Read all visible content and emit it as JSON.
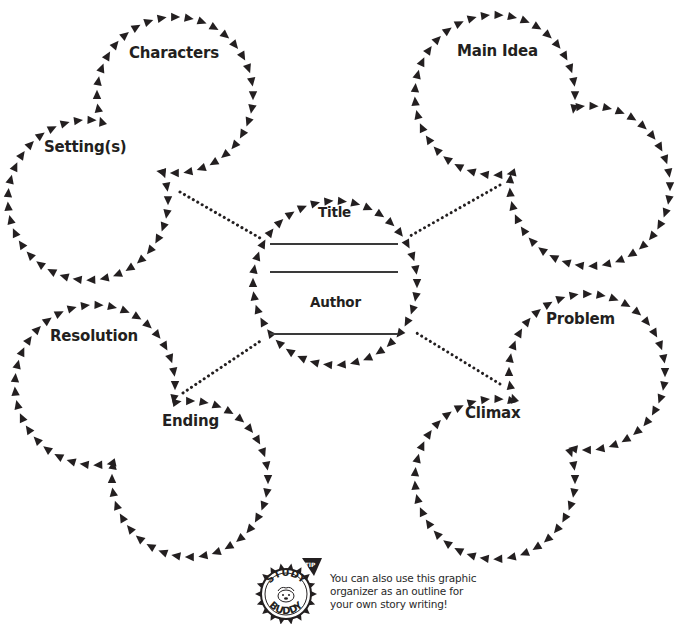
{
  "document": {
    "type": "story graphic organizer",
    "colors": {
      "ink": "#231f20",
      "line": "#3a3a3a",
      "background": "#ffffff"
    }
  },
  "center": {
    "title_label": "Title",
    "author_label": "Author",
    "blank_lines": 3
  },
  "clusters": [
    {
      "id": "top-left",
      "labels": [
        "Characters",
        "Setting(s)"
      ]
    },
    {
      "id": "top-right",
      "labels": [
        "Main Idea",
        ""
      ]
    },
    {
      "id": "bottom-left",
      "labels": [
        "Resolution",
        "Ending"
      ]
    },
    {
      "id": "bottom-right",
      "labels": [
        "Problem",
        "Climax"
      ]
    }
  ],
  "labels": {
    "characters": "Characters",
    "setting": "Setting(s)",
    "main_idea": "Main Idea",
    "resolution": "Resolution",
    "ending": "Ending",
    "problem": "Problem",
    "climax": "Climax"
  },
  "tip": {
    "badge_top": "STUDY",
    "badge_bottom": "BUDDY",
    "badge_flag": "TIP",
    "lines": [
      "You can also use this graphic",
      "organizer as an outline for",
      "your own story writing!"
    ]
  },
  "geometry": {
    "circles": [
      {
        "name": "characters-circle",
        "cx": 175,
        "cy": 95,
        "r": 78,
        "partner": 1
      },
      {
        "name": "setting-circle",
        "cx": 88,
        "cy": 200,
        "r": 80,
        "partner": 0
      },
      {
        "name": "main-idea-circle",
        "cx": 495,
        "cy": 95,
        "r": 80,
        "partner": 3
      },
      {
        "name": "main-idea-second-circle",
        "cx": 590,
        "cy": 186,
        "r": 80,
        "partner": 2
      },
      {
        "name": "resolution-circle",
        "cx": 95,
        "cy": 385,
        "r": 80,
        "partner": 5
      },
      {
        "name": "ending-circle",
        "cx": 190,
        "cy": 479,
        "r": 78,
        "partner": 4
      },
      {
        "name": "problem-circle",
        "cx": 587,
        "cy": 372,
        "r": 78,
        "partner": 7
      },
      {
        "name": "climax-circle",
        "cx": 495,
        "cy": 479,
        "r": 80,
        "partner": 6
      },
      {
        "name": "title-author-circle",
        "cx": 335,
        "cy": 283,
        "r": 82,
        "partner": -1
      }
    ],
    "connectors": [
      {
        "name": "connector-top-left",
        "x1": 180,
        "y1": 192,
        "x2": 260,
        "y2": 238
      },
      {
        "name": "connector-top-right",
        "x1": 500,
        "y1": 185,
        "x2": 410,
        "y2": 236
      },
      {
        "name": "connector-bottom-left",
        "x1": 183,
        "y1": 393,
        "x2": 262,
        "y2": 340
      },
      {
        "name": "connector-bottom-right",
        "x1": 500,
        "y1": 384,
        "x2": 415,
        "y2": 332
      }
    ],
    "triangle_spacing": 13.5,
    "triangle_size": 7
  }
}
